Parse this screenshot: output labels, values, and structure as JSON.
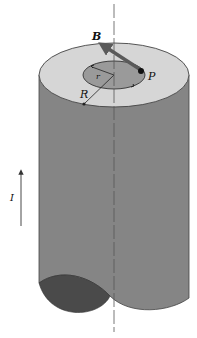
{
  "figure": {
    "labels": {
      "B": "B",
      "P": "P",
      "r": "r",
      "R": "R",
      "I": "I"
    },
    "colors": {
      "top_face": "#d6d6d6",
      "inner_disk": "#9a9a9a",
      "side": "#858585",
      "bottom_cut": "#4a4a4a",
      "arrow_B": "#5a5a5a",
      "outline": "#333333"
    }
  }
}
